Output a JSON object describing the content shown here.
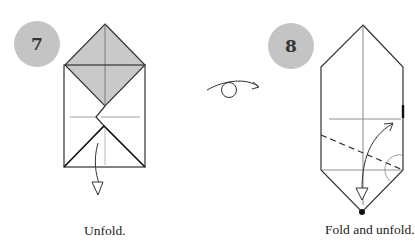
{
  "steps": [
    {
      "number": "7",
      "caption": "Unfold."
    },
    {
      "number": "8",
      "caption": "Fold and unfold."
    }
  ],
  "colors": {
    "badge": "#c4c4c4",
    "shaded_flap": "#c9c9c9",
    "line": "#333333",
    "crease": "#777777"
  },
  "symbols": [
    "turn-over-icon",
    "unfold-arrow-icon",
    "fold-unfold-arrow-icon",
    "valley-fold-dashed-line",
    "reference-point-dot"
  ]
}
